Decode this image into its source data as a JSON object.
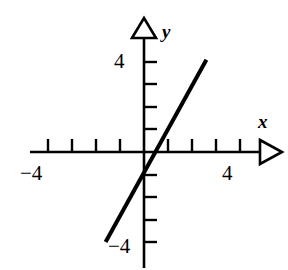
{
  "figure": {
    "kind": "coordinate-plane-line-graph",
    "width": 288,
    "height": 270,
    "background_color": "#ffffff",
    "ink_color": "#000000"
  },
  "axes": {
    "x_axis_label": "x",
    "y_axis_label": "y",
    "origin_px": {
      "x": 144,
      "y": 152
    },
    "unit_px": {
      "x": 24,
      "y": 22.5
    },
    "x_tick_labels": [
      {
        "value": -4,
        "text": "−4"
      },
      {
        "value": 4,
        "text": "4"
      }
    ],
    "y_tick_labels": [
      {
        "value": 4,
        "text": "4"
      },
      {
        "value": -4,
        "text": "−4"
      }
    ],
    "x_tick_values": [
      -4,
      -3,
      -2,
      -1,
      1,
      2,
      3,
      4
    ],
    "y_tick_values": [
      4,
      3,
      2,
      1,
      -1,
      -2,
      -3,
      -4
    ],
    "x_arrow": "right",
    "y_arrow": "up"
  },
  "chart_data": {
    "type": "line",
    "title": "",
    "xlabel": "x",
    "ylabel": "y",
    "xlim": [
      -5.2,
      6.0
    ],
    "ylim": [
      -5.3,
      5.6
    ],
    "grid": false,
    "legend": "none",
    "x_ticks": [
      -4,
      -3,
      -2,
      -1,
      0,
      1,
      2,
      3,
      4
    ],
    "y_ticks": [
      -4,
      -3,
      -2,
      -1,
      0,
      1,
      2,
      3,
      4
    ],
    "x_tick_labels_shown": [
      "-4",
      "4"
    ],
    "y_tick_labels_shown": [
      "4",
      "-4"
    ],
    "series": [
      {
        "name": "line",
        "equation": "y = 2x",
        "slope": 2,
        "intercept": 0,
        "x": [
          -1.6,
          2.6
        ],
        "y": [
          -4.0,
          4.1
        ],
        "endpoints": [
          {
            "x": -1.6,
            "y": -4.0
          },
          {
            "x": 2.6,
            "y": 4.1
          }
        ],
        "line_width_px": 4,
        "color": "#000000"
      }
    ]
  }
}
